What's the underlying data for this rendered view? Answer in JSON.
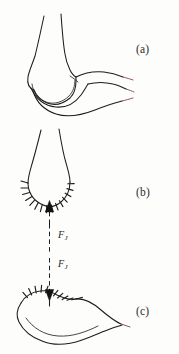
{
  "figure": {
    "width": 179,
    "height": 354,
    "background_color": "#fdfdfc",
    "ink_color": "#1d1d1d",
    "accent_color": "#8e4a63"
  },
  "panels": [
    {
      "id": "a",
      "label": "(a)",
      "caption": "Intact joint: two articulating bones shown in side view"
    },
    {
      "id": "b",
      "label": "(b)",
      "caption": "Upper bone end with articular cartilage hatching and upward joint force arrow"
    },
    {
      "id": "c",
      "label": "(c)",
      "caption": "Lower bone surface with articular cartilage hatching and downward joint force arrow"
    }
  ],
  "force_labels": [
    {
      "id": "force-upper",
      "symbol": "F",
      "subscript": "J",
      "text": "FJ",
      "direction": "up",
      "applies_to": "b"
    },
    {
      "id": "force-lower",
      "symbol": "F",
      "subscript": "J",
      "text": "FJ",
      "direction": "down",
      "applies_to": "c"
    }
  ],
  "annotations": {
    "dashed_line_style": "dash-dot vertical",
    "arrowhead_style": "solid filled triangle",
    "hatching": "radial tick marks representing articular cartilage"
  }
}
